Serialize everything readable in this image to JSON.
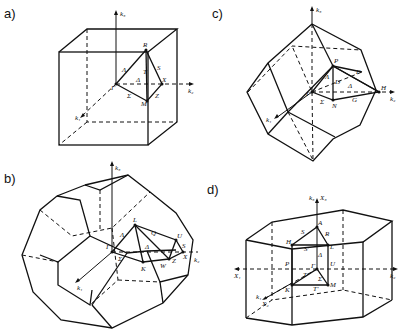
{
  "panels": [
    {
      "id": "a",
      "label": "a)",
      "shape": "simple cubic Brillouin zone (cube)",
      "points": [
        "Γ",
        "R",
        "X",
        "M",
        "Λ",
        "Δ",
        "Σ",
        "T",
        "S",
        "Z"
      ],
      "axes": [
        "k1",
        "k2",
        "k3"
      ]
    },
    {
      "id": "b",
      "label": "b)",
      "shape": "fcc Brillouin zone (truncated octahedron)",
      "points": [
        "Γ",
        "L",
        "K",
        "W",
        "X",
        "U",
        "Λ",
        "Δ",
        "Σ",
        "Q",
        "S",
        "Z"
      ],
      "axes": [
        "k1",
        "k2",
        "k3"
      ]
    },
    {
      "id": "c",
      "label": "c)",
      "shape": "bcc Brillouin zone (rhombic dodecahedron)",
      "points": [
        "Γ",
        "P",
        "N",
        "H",
        "Λ",
        "Δ",
        "Σ",
        "D",
        "F",
        "G"
      ],
      "axes": [
        "k1",
        "k2",
        "k3"
      ]
    },
    {
      "id": "d",
      "label": "d)",
      "shape": "hexagonal Brillouin zone (hexagonal prism)",
      "points": [
        "Γ",
        "A",
        "H",
        "L",
        "K",
        "M",
        "S",
        "S'",
        "R",
        "P",
        "U",
        "Δ",
        "T",
        "T'",
        "Σ"
      ],
      "axes": [
        "k1",
        "k2",
        "k3",
        "X1",
        "X2",
        "X3"
      ]
    }
  ],
  "labels": {
    "a": {
      "title": "a)",
      "k1": "k₁",
      "k2": "k₂",
      "k3": "k₃",
      "R": "R",
      "X": "X",
      "M": "M",
      "G": "Γ",
      "Lam": "Λ",
      "Del": "Δ",
      "Sig": "Σ",
      "T": "T",
      "S": "S",
      "Z": "Z"
    },
    "b": {
      "title": "b)",
      "k1": "k₁",
      "k2": "k₂",
      "k3": "k₃",
      "L": "L",
      "K": "K",
      "W": "W",
      "X": "X",
      "U": "U",
      "G": "Γ",
      "Lam": "Λ",
      "Del": "Δ",
      "Sig": "Σ",
      "Q": "Q",
      "S": "S",
      "Z": "Z"
    },
    "c": {
      "title": "c)",
      "k1": "k₁",
      "k2": "k₂",
      "k3": "k₃",
      "P": "P",
      "N": "N",
      "H": "H",
      "G": "Γ",
      "Lam": "Λ",
      "Del": "Δ",
      "Sig": "Σ",
      "D": "D",
      "F": "F",
      "Gp": "G"
    },
    "d": {
      "title": "d)",
      "k1": "k₁",
      "k2": "k₂",
      "k3": "k₃",
      "X1": "X₁",
      "X2": "X₂",
      "X3": "X₃",
      "A": "A",
      "H": "H",
      "L": "L",
      "K": "K",
      "M": "M",
      "G": "Γ",
      "S": "S",
      "Sp": "S'",
      "R": "R",
      "P": "P",
      "U": "U",
      "Del": "Δ",
      "T": "T",
      "Tp": "T'",
      "Sig": "Σ"
    }
  }
}
